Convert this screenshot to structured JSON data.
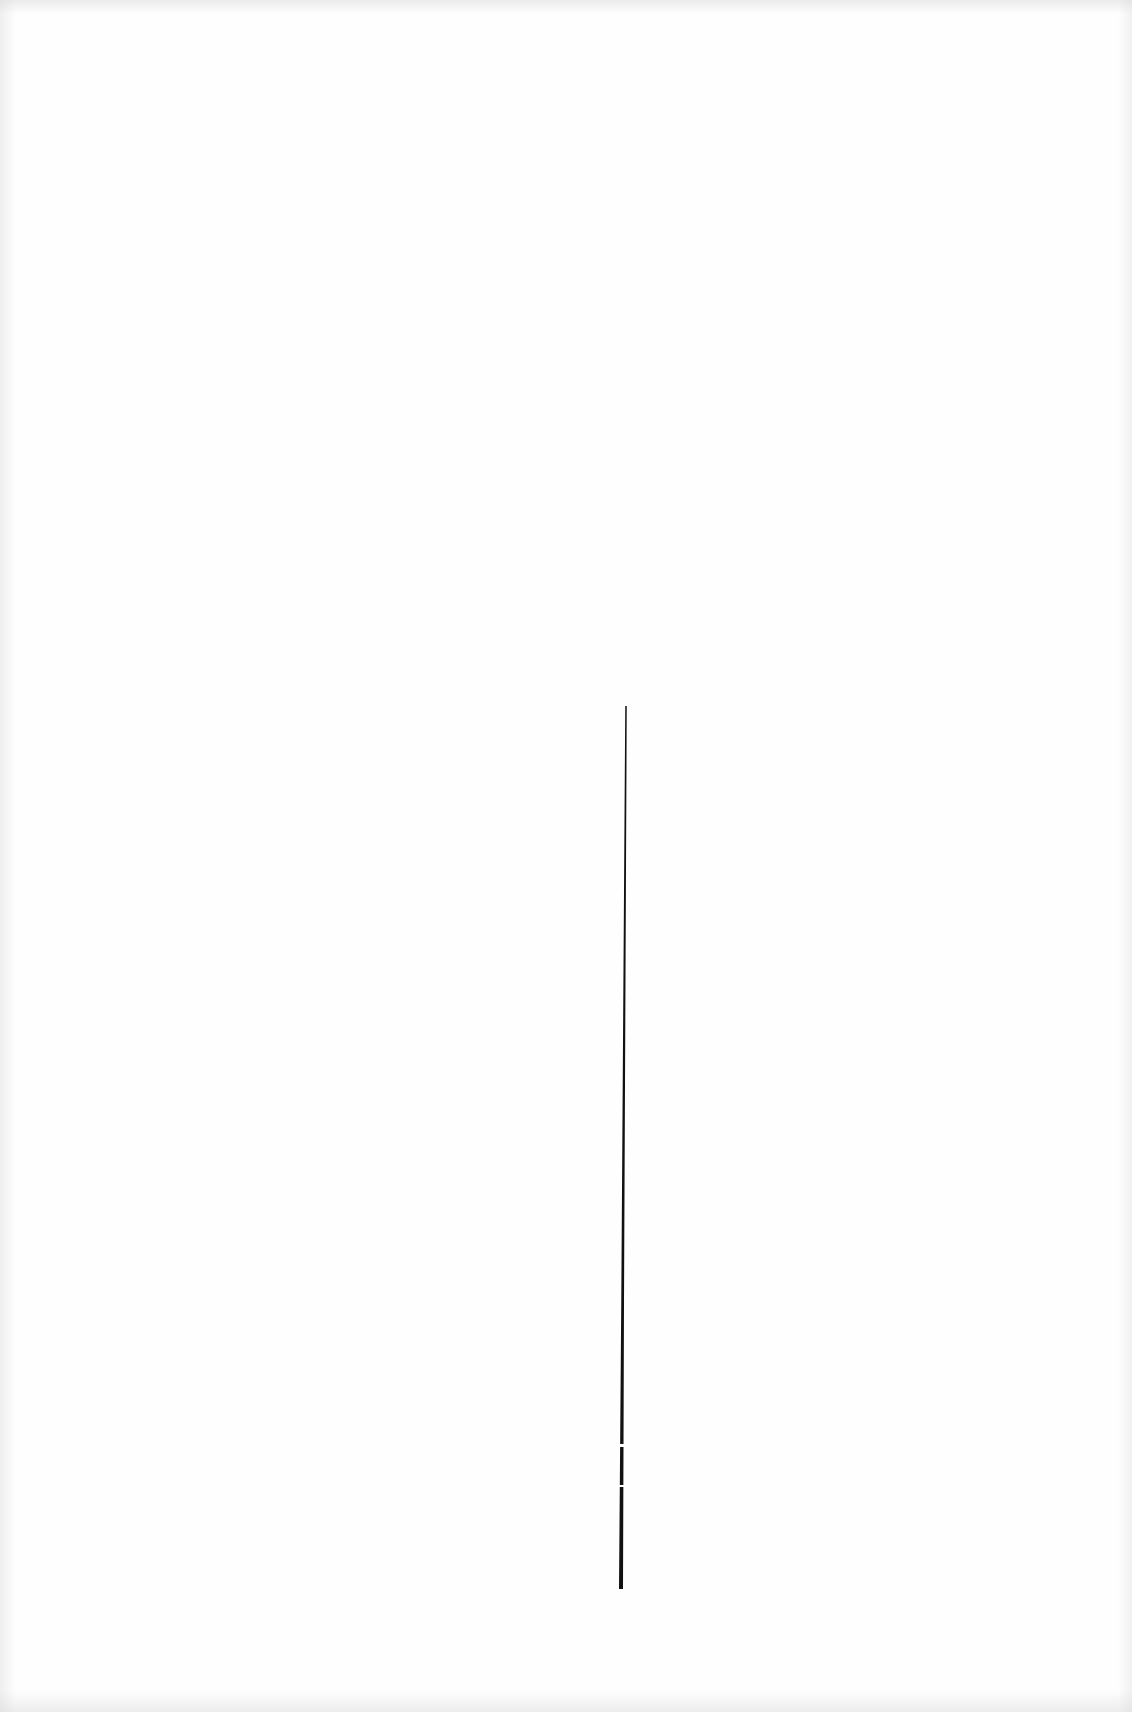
{
  "page": {
    "background": "#fefefe",
    "text_content": []
  },
  "vertical_rule": {
    "color": "#111111",
    "top": {
      "x": 626,
      "y": 706,
      "width": 1.5
    },
    "bottom": {
      "x": 621,
      "y": 1589,
      "width": 4
    }
  }
}
